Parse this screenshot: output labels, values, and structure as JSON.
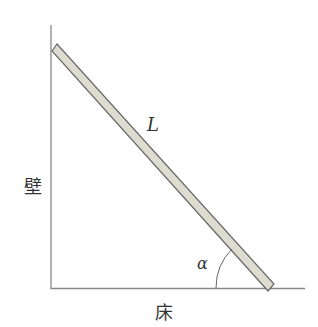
{
  "diagram": {
    "type": "ladder-against-wall",
    "labels": {
      "ladder_length": "L",
      "wall": "壁",
      "floor": "床",
      "angle": "α"
    },
    "colors": {
      "line": "#888888",
      "ladder_fill": "#dcdcd0",
      "ladder_stroke": "#666666",
      "text": "#333333"
    }
  }
}
